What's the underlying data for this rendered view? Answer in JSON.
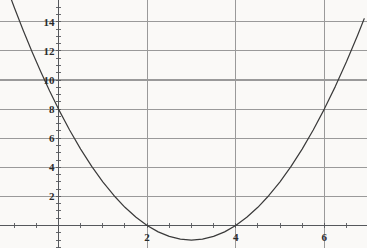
{
  "chart_data": {
    "type": "line",
    "title": "",
    "subtitle": "",
    "xlabel": "",
    "ylabel": "",
    "function": "y = x^2 - 6x + 8",
    "xlim": [
      -1.2,
      6.9
    ],
    "ylim": [
      -1.6,
      15.5
    ],
    "x_ticks": [
      2,
      4,
      6
    ],
    "x_tick_labels": [
      "2",
      "4",
      "6"
    ],
    "y_ticks": [
      2,
      4,
      6,
      8,
      10,
      12,
      14
    ],
    "y_tick_labels": [
      "2",
      "4",
      "6",
      "8",
      "10",
      "12",
      "14"
    ],
    "x_minor_tick_step": 0.5,
    "y_minor_tick_step": 0.5,
    "grid": {
      "horizontal": true,
      "vertical": true,
      "color": "#9a9a9a"
    },
    "legend": null,
    "series": [
      {
        "name": "y = x^2 - 6x + 8",
        "color": "#3a3a3a",
        "x": [
          -1.2,
          -1.0,
          -0.8,
          -0.6,
          -0.4,
          -0.2,
          0.0,
          0.25,
          0.5,
          0.75,
          1.0,
          1.25,
          1.5,
          1.75,
          2.0,
          2.25,
          2.5,
          2.75,
          3.0,
          3.25,
          3.5,
          3.75,
          4.0,
          4.25,
          4.5,
          4.75,
          5.0,
          5.25,
          5.5,
          5.75,
          6.0,
          6.25,
          6.5,
          6.75,
          6.9
        ],
        "y": [
          16.64,
          15.0,
          13.44,
          11.96,
          10.56,
          9.24,
          8.0,
          6.5625,
          5.25,
          4.0625,
          3.0,
          2.0625,
          1.25,
          0.5625,
          0.0,
          -0.4375,
          -0.75,
          -0.9375,
          -1.0,
          -0.9375,
          -0.75,
          -0.4375,
          0.0,
          0.5625,
          1.25,
          2.0625,
          3.0,
          4.0625,
          5.25,
          6.5625,
          8.0,
          9.5625,
          11.25,
          13.0625,
          14.21
        ]
      }
    ],
    "key_points": {
      "vertex": [
        3,
        -1
      ],
      "x_intercepts": [
        2,
        4
      ],
      "y_intercept": [
        0,
        8
      ]
    },
    "axes": {
      "x_axis_visible": true,
      "y_axis_visible": true,
      "axis_color": "#55585c"
    },
    "background_color": "#faf9f7"
  }
}
